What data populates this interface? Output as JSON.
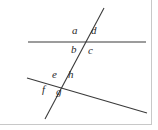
{
  "figure": {
    "kind": "geometry-diagram",
    "width": 158,
    "height": 130,
    "background_color": "#ffffff",
    "line_color": "#3a3a3a",
    "label_color": "#2b2b2b",
    "border_color": "#c8c8c8",
    "lines": [
      {
        "name": "horizontal-line",
        "x1": 28,
        "y1": 42,
        "x2": 146,
        "y2": 42
      },
      {
        "name": "slanted-line",
        "x1": 27,
        "y1": 78,
        "x2": 147,
        "y2": 113
      },
      {
        "name": "transversal-line",
        "x1": 104,
        "y1": 8,
        "x2": 45,
        "y2": 119
      }
    ],
    "intersections": [
      {
        "name": "upper-intersection",
        "x": 85,
        "y": 42
      },
      {
        "name": "lower-intersection",
        "x": 64,
        "y": 82
      }
    ],
    "labels": [
      {
        "id": "a",
        "text": "a",
        "x": 72,
        "y": 30,
        "position": "upper-left"
      },
      {
        "id": "d",
        "text": "d",
        "x": 91,
        "y": 30,
        "position": "upper-right"
      },
      {
        "id": "b",
        "text": "b",
        "x": 71,
        "y": 44,
        "position": "lower-left"
      },
      {
        "id": "c",
        "text": "c",
        "x": 88,
        "y": 45,
        "position": "lower-right"
      },
      {
        "id": "e",
        "text": "e",
        "x": 52,
        "y": 74,
        "position": "upper-left"
      },
      {
        "id": "h",
        "text": "h",
        "x": 68,
        "y": 74,
        "position": "upper-right"
      },
      {
        "id": "f",
        "text": "f",
        "x": 42,
        "y": 87,
        "position": "lower-left"
      },
      {
        "id": "g",
        "text": "g",
        "x": 56,
        "y": 89,
        "position": "lower-right"
      }
    ]
  }
}
